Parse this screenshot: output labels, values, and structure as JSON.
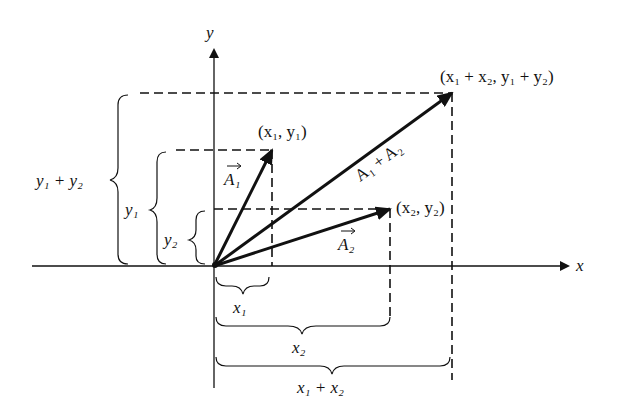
{
  "diagram": {
    "axes": {
      "x_label": "x",
      "y_label": "y"
    },
    "points": {
      "p1": {
        "label": "(x₁, y₁)"
      },
      "p2": {
        "label": "(x₂, y₂)"
      },
      "sum": {
        "label": "(x₁ + x₂, y₁ + y₂)"
      }
    },
    "vectors": {
      "a1": {
        "label": "A₁"
      },
      "a2": {
        "label": "A₂"
      },
      "sum": {
        "label": "A₁ + A₂"
      }
    },
    "braces": {
      "x1": "x₁",
      "x2": "x₂",
      "x_sum": "x₁ + x₂",
      "y1": "y₁",
      "y2": "y₂",
      "y_sum": "y₁ + y₂"
    }
  }
}
